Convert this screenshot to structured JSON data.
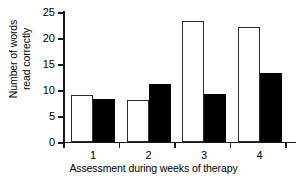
{
  "chart_data": {
    "type": "bar",
    "title": "",
    "subtitle": "",
    "xlabel": "Assessment during weeks of therapy",
    "ylabel": "Number of words\nread correctly",
    "categories": [
      "1",
      "2",
      "3",
      "4"
    ],
    "series": [
      {
        "name": "open",
        "style": "open-white-bar",
        "values": [
          9.0,
          8.1,
          23.3,
          22.1
        ]
      },
      {
        "name": "filled",
        "style": "filled-black-bar",
        "values": [
          8.2,
          11.2,
          9.2,
          13.2
        ]
      }
    ],
    "ylim": [
      0,
      25
    ],
    "yticks": [
      0,
      5,
      10,
      15,
      20,
      25
    ],
    "ytick_labels": [
      "0",
      "5",
      "10",
      "15",
      "20",
      "25"
    ],
    "xtick_labels": [
      "1",
      "2",
      "3",
      "4"
    ],
    "grid": false,
    "legend": "none",
    "colors": {
      "open_fill": "#ffffff",
      "open_edge": "#2b2b2b",
      "filled_fill": "#000000",
      "axis": "#1a1a1a",
      "background": "#ffffff"
    }
  }
}
